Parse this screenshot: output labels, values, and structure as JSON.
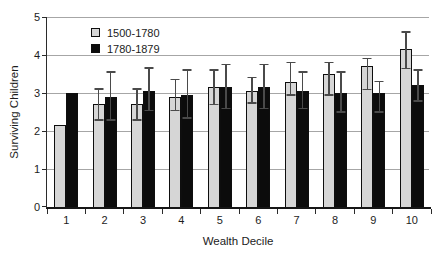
{
  "chart_data": {
    "type": "bar",
    "title": "",
    "xlabel": "Wealth Decile",
    "ylabel": "Surviving Children",
    "categories": [
      "1",
      "2",
      "3",
      "4",
      "5",
      "6",
      "7",
      "8",
      "9",
      "10"
    ],
    "ylim": [
      0,
      5
    ],
    "yticks": [
      0,
      1,
      2,
      3,
      4,
      5
    ],
    "grid": "horizontal",
    "legend_position": "inside-top-left",
    "error_bars": "decile 1 has no error bars; caps given as absolute y-values",
    "series": [
      {
        "name": "1500-1780",
        "color": "#d6d6d6",
        "values": [
          2.15,
          2.7,
          2.7,
          2.9,
          3.15,
          3.05,
          3.3,
          3.5,
          3.7,
          4.15
        ],
        "error_cap_upper": [
          null,
          3.1,
          3.1,
          3.35,
          3.6,
          3.4,
          3.8,
          3.8,
          3.9,
          4.6
        ],
        "error_cap_lower": [
          null,
          2.3,
          2.3,
          2.55,
          2.7,
          2.75,
          2.95,
          2.95,
          3.1,
          3.65
        ]
      },
      {
        "name": "1780-1879",
        "color": "#0c0c0c",
        "values": [
          3.0,
          2.9,
          3.05,
          2.95,
          3.15,
          3.15,
          3.05,
          3.0,
          3.0,
          3.2
        ],
        "error_cap_upper": [
          null,
          3.55,
          3.65,
          3.6,
          3.75,
          3.75,
          3.55,
          3.55,
          3.3,
          3.6
        ],
        "error_cap_lower": [
          null,
          2.3,
          2.55,
          2.35,
          2.6,
          2.6,
          2.6,
          2.5,
          2.5,
          2.8
        ]
      }
    ],
    "style_colors": {
      "gridline": "#a6a6a6",
      "axis": "#2b2b2b",
      "error_bar": "#4a4a4a",
      "text": "#1c1c1c",
      "background": "#ffffff"
    }
  }
}
